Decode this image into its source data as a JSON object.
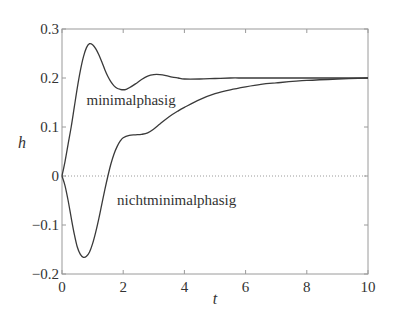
{
  "chart_data": {
    "type": "line",
    "title": "",
    "xlabel": "t",
    "ylabel": "h",
    "xlim": [
      0,
      10
    ],
    "ylim": [
      -0.2,
      0.3
    ],
    "xticks": [
      0,
      2,
      4,
      6,
      8,
      10
    ],
    "xtick_labels": [
      "0",
      "2",
      "4",
      "6",
      "8",
      "10"
    ],
    "yticks": [
      -0.2,
      -0.1,
      0,
      0.1,
      0.2,
      0.3
    ],
    "ytick_labels": [
      "−0.2",
      "−0.1",
      "0",
      "0.1",
      "0.2",
      "0.3"
    ],
    "grid": false,
    "zero_line": {
      "y": 0,
      "style": "dotted"
    },
    "legend": null,
    "annotations": [
      {
        "text": "minimalphasig",
        "x": 0.8,
        "y": 0.145
      },
      {
        "text": "nichtminimalphasig",
        "x": 1.8,
        "y": -0.06
      }
    ],
    "series": [
      {
        "name": "minimalphasig",
        "x": [
          0,
          0.1,
          0.2,
          0.3,
          0.4,
          0.5,
          0.6,
          0.7,
          0.8,
          0.9,
          1.0,
          1.1,
          1.2,
          1.3,
          1.4,
          1.5,
          1.6,
          1.7,
          1.8,
          1.9,
          2.0,
          2.1,
          2.2,
          2.4,
          2.6,
          2.8,
          3.0,
          3.2,
          3.4,
          3.6,
          3.8,
          4.0,
          4.5,
          5.0,
          5.5,
          6.0,
          7.0,
          8.0,
          9.0,
          10.0
        ],
        "values": [
          0,
          0.03,
          0.065,
          0.1,
          0.14,
          0.18,
          0.215,
          0.243,
          0.262,
          0.27,
          0.268,
          0.26,
          0.248,
          0.233,
          0.217,
          0.203,
          0.192,
          0.184,
          0.179,
          0.177,
          0.176,
          0.177,
          0.18,
          0.188,
          0.197,
          0.204,
          0.207,
          0.207,
          0.205,
          0.202,
          0.2,
          0.198,
          0.198,
          0.199,
          0.2,
          0.2,
          0.2,
          0.2,
          0.2,
          0.2
        ]
      },
      {
        "name": "nichtminimalphasig",
        "x": [
          0,
          0.1,
          0.2,
          0.3,
          0.4,
          0.5,
          0.6,
          0.7,
          0.8,
          0.9,
          1.0,
          1.1,
          1.2,
          1.3,
          1.4,
          1.5,
          1.6,
          1.7,
          1.8,
          1.9,
          2.0,
          2.2,
          2.4,
          2.6,
          2.8,
          3.0,
          3.2,
          3.5,
          3.8,
          4.0,
          4.5,
          5.0,
          5.5,
          6.0,
          6.5,
          7.0,
          8.0,
          9.0,
          10.0
        ],
        "values": [
          0,
          -0.02,
          -0.05,
          -0.085,
          -0.118,
          -0.145,
          -0.16,
          -0.166,
          -0.164,
          -0.155,
          -0.138,
          -0.115,
          -0.088,
          -0.058,
          -0.028,
          0.0,
          0.025,
          0.045,
          0.06,
          0.071,
          0.078,
          0.083,
          0.084,
          0.085,
          0.088,
          0.096,
          0.106,
          0.121,
          0.133,
          0.14,
          0.156,
          0.168,
          0.176,
          0.182,
          0.187,
          0.19,
          0.195,
          0.198,
          0.2
        ]
      }
    ]
  },
  "layout": {
    "plot_left": 62,
    "plot_right": 368,
    "plot_top": 29,
    "plot_bottom": 274,
    "line_color": "#3a3a3a",
    "axis_color": "#9a9a9a"
  }
}
